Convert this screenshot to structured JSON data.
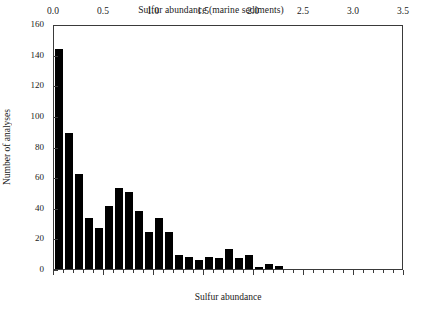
{
  "chart_data": {
    "type": "bar",
    "title": "Sulfur abundance (marine sediments)",
    "xlabel": "Sulfur abundance",
    "ylabel": "Number of analyses",
    "xlim": [
      0.0,
      3.5
    ],
    "ylim": [
      0,
      160
    ],
    "grid": false,
    "legend": null,
    "bin_width": 0.1,
    "bar_color": "#000000",
    "frame_color": "#3a3a3a",
    "x_major_ticks": [
      0.0,
      0.5,
      1.0,
      1.5,
      2.0,
      2.5,
      3.0,
      3.5
    ],
    "x_major_tick_labels": [
      "0.0",
      "0.5",
      "1.0",
      "1.5",
      "2.0",
      "2.5",
      "3.0",
      "3.5"
    ],
    "x_minor_tick_interval": 0.1,
    "y_ticks": [
      0,
      20,
      40,
      60,
      80,
      100,
      120,
      140,
      160
    ],
    "y_tick_labels": [
      "0",
      "20",
      "40",
      "60",
      "80",
      "100",
      "120",
      "140",
      "160"
    ],
    "bin_centers": [
      0.05,
      0.15,
      0.25,
      0.35,
      0.45,
      0.55,
      0.65,
      0.75,
      0.85,
      0.95,
      1.05,
      1.15,
      1.25,
      1.35,
      1.45,
      1.55,
      1.65,
      1.75,
      1.85,
      1.95,
      2.05,
      2.15,
      2.25,
      2.35
    ],
    "bin_starts": [
      0.0,
      0.1,
      0.2,
      0.3,
      0.4,
      0.5,
      0.6,
      0.7,
      0.8,
      0.9,
      1.0,
      1.1,
      1.2,
      1.3,
      1.4,
      1.5,
      1.6,
      1.7,
      1.8,
      1.9,
      2.0,
      2.1,
      2.2,
      2.3
    ],
    "values": [
      144,
      89,
      62,
      33,
      27,
      41,
      53,
      50,
      38,
      24,
      33,
      24,
      9,
      8,
      6,
      8,
      7,
      13,
      7,
      9,
      1,
      3,
      2,
      0
    ]
  }
}
